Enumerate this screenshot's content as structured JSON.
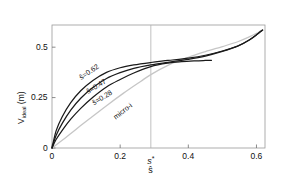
{
  "chart_data": {
    "type": "line",
    "title": "",
    "xlabel": "ŝ",
    "ylabel": "V_ideal (m)",
    "xlim": [
      0,
      0.625
    ],
    "ylim": [
      0,
      0.61
    ],
    "xticks": [
      0,
      0.2,
      0.4,
      0.6
    ],
    "xticklabels": [
      "0",
      "0.2",
      "0.4",
      "0.6"
    ],
    "yticks": [
      0,
      0.25,
      0.5
    ],
    "yticklabels": [
      "0",
      "0.25",
      "0.5"
    ],
    "grid": false,
    "legend": "inline-curve-labels",
    "annotations": [
      {
        "text": "s*",
        "type": "x-axis-tick",
        "x": 0.29
      },
      {
        "text": "vertical reference line at s*",
        "x": 0.29
      }
    ],
    "series": [
      {
        "name": "ŝ=0.62",
        "label": "ŝ=0.62",
        "color": "#1a1a1a",
        "x": [
          0,
          0.012,
          0.03,
          0.055,
          0.085,
          0.12,
          0.16,
          0.2,
          0.24,
          0.29,
          0.34,
          0.4,
          0.45,
          0.5,
          0.545,
          0.58,
          0.605,
          0.618
        ],
        "y": [
          0,
          0.085,
          0.155,
          0.225,
          0.285,
          0.335,
          0.375,
          0.398,
          0.412,
          0.424,
          0.434,
          0.446,
          0.46,
          0.481,
          0.506,
          0.537,
          0.568,
          0.585
        ]
      },
      {
        "name": "ŝ=0.47",
        "label": "ŝ=0.47",
        "color": "#1a1a1a",
        "x": [
          0,
          0.012,
          0.03,
          0.055,
          0.085,
          0.12,
          0.16,
          0.2,
          0.24,
          0.29,
          0.34,
          0.4,
          0.45,
          0.5,
          0.545,
          0.58,
          0.605,
          0.618
        ],
        "y": [
          0,
          0.062,
          0.122,
          0.188,
          0.248,
          0.3,
          0.345,
          0.374,
          0.395,
          0.412,
          0.425,
          0.44,
          0.456,
          0.479,
          0.505,
          0.537,
          0.568,
          0.585
        ]
      },
      {
        "name": "ŝ=0.28",
        "label": "ŝ=0.28",
        "color": "#1a1a1a",
        "x": [
          0,
          0.012,
          0.03,
          0.055,
          0.085,
          0.12,
          0.16,
          0.2,
          0.24,
          0.29,
          0.34,
          0.38,
          0.42,
          0.45,
          0.468
        ],
        "y": [
          0,
          0.042,
          0.088,
          0.143,
          0.198,
          0.252,
          0.303,
          0.34,
          0.372,
          0.404,
          0.421,
          0.428,
          0.432,
          0.434,
          0.435
        ]
      },
      {
        "name": "micro-i",
        "label": "micro-i",
        "color": "#c6c6c6",
        "x": [
          0,
          0.03,
          0.07,
          0.11,
          0.16,
          0.21,
          0.26,
          0.29,
          0.34,
          0.4,
          0.45,
          0.5,
          0.545,
          0.58,
          0.605,
          0.618
        ],
        "y": [
          0,
          0.038,
          0.092,
          0.145,
          0.21,
          0.272,
          0.33,
          0.364,
          0.41,
          0.45,
          0.478,
          0.503,
          0.527,
          0.552,
          0.573,
          0.585
        ]
      }
    ]
  },
  "axes": {
    "ylabel_main": "V",
    "ylabel_sub": "ideal",
    "ylabel_unit": " (m)",
    "xlabel": "ŝ",
    "xtick_star": "s",
    "xtick_star_mark": "*"
  }
}
